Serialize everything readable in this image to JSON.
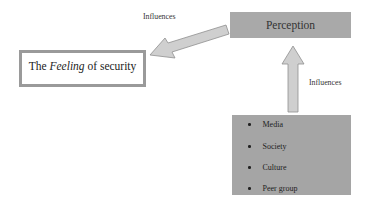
{
  "diagram": {
    "nodes": {
      "perception": {
        "label": "Perception",
        "color": "#a9a9a9"
      },
      "feeling": {
        "prefix": "The ",
        "emphasis": "Feeling",
        "suffix": " of security",
        "border_color": "#9a9a9a"
      },
      "factors": {
        "color": "#a5a5a5",
        "items": [
          "Media",
          "Society",
          "Culture",
          "Peer group"
        ]
      }
    },
    "edges": [
      {
        "from": "perception",
        "to": "feeling",
        "label": "Influences",
        "color": "#c8c8c8"
      },
      {
        "from": "factors",
        "to": "perception",
        "label": "Influences",
        "color": "#c8c8c8"
      }
    ]
  }
}
